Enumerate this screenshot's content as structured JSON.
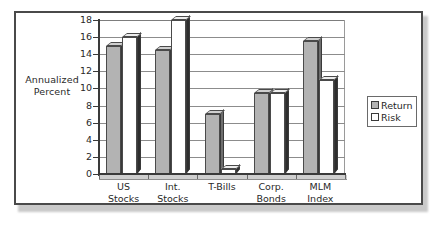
{
  "chart_data": {
    "type": "bar",
    "title": "",
    "xlabel": "",
    "ylabel": "Annualized Percent",
    "ylim": [
      0,
      18
    ],
    "yticks": [
      0,
      2,
      4,
      6,
      8,
      10,
      12,
      14,
      16,
      18
    ],
    "grid": true,
    "legend_position": "right",
    "categories": [
      "US Stocks",
      "Int. Stocks",
      "T-Bills",
      "Corp. Bonds",
      "MLM Index"
    ],
    "category_lines": [
      [
        "US",
        "Stocks"
      ],
      [
        "Int.",
        "Stocks"
      ],
      [
        "T-Bills",
        ""
      ],
      [
        "Corp.",
        "Bonds"
      ],
      [
        "MLM",
        "Index"
      ]
    ],
    "series": [
      {
        "name": "Return",
        "color": "#b3b3b3",
        "values": [
          15.0,
          14.5,
          7.0,
          9.5,
          15.5
        ]
      },
      {
        "name": "Risk",
        "color": "#ffffff",
        "values": [
          16.0,
          18.0,
          0.6,
          9.5,
          11.0
        ]
      }
    ]
  },
  "legend": {
    "items": [
      {
        "label": "Return",
        "swatch": "gray-swatch-icon"
      },
      {
        "label": "Risk",
        "swatch": "white-swatch-icon"
      }
    ]
  },
  "axis": {
    "y_title_line1": "Annualized",
    "y_title_line2": "Percent"
  }
}
